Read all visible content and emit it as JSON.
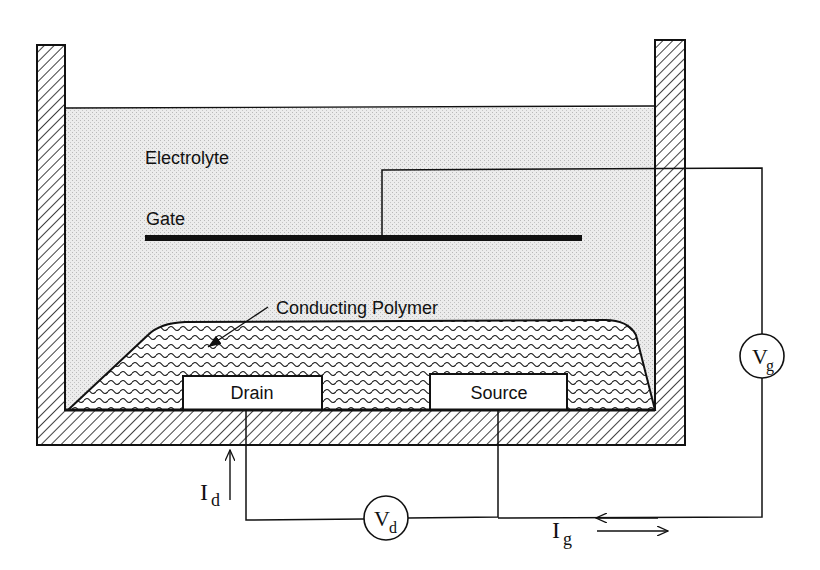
{
  "diagram": {
    "type": "electrochemical transistor schematic",
    "labels": {
      "electrolyte": "Electrolyte",
      "gate": "Gate",
      "polymer": "Conducting Polymer",
      "drain": "Drain",
      "source": "Source"
    },
    "sources": {
      "vd": {
        "main": "V",
        "sub": "d"
      },
      "vg": {
        "main": "V",
        "sub": "g"
      }
    },
    "currents": {
      "id": {
        "main": "I",
        "sub": "d"
      },
      "ig": {
        "main": "I",
        "sub": "g"
      }
    },
    "colors": {
      "line": "#111111",
      "electrolyte_fill": "#e6e6e6",
      "background": "#ffffff"
    }
  }
}
